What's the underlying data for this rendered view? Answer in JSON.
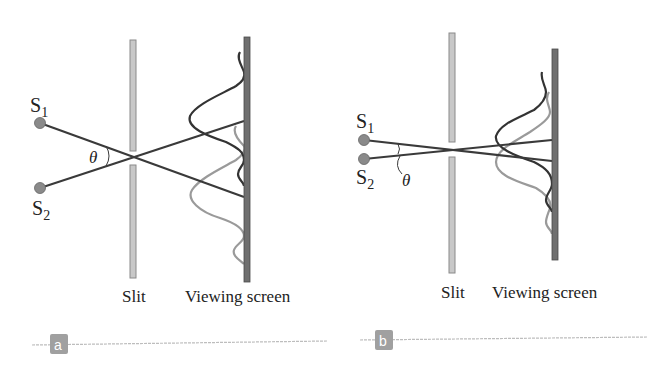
{
  "figure": {
    "panels": [
      {
        "id": "a",
        "badge": "a",
        "source1": {
          "label": "S",
          "sub": "1"
        },
        "source2": {
          "label": "S",
          "sub": "2"
        },
        "angle_label": "θ",
        "slit_label": "Slit",
        "screen_label": "Viewing screen"
      },
      {
        "id": "b",
        "badge": "b",
        "source1": {
          "label": "S",
          "sub": "1"
        },
        "source2": {
          "label": "S",
          "sub": "2"
        },
        "angle_label": "θ",
        "slit_label": "Slit",
        "screen_label": "Viewing screen"
      }
    ],
    "colors": {
      "ray": "#3a3a3a",
      "pattern_s1": "#333333",
      "pattern_s2": "#9a9a9a",
      "slit": "#c8c8c8",
      "slit_border": "#8a8a8a",
      "screen": "#6f6f6f",
      "source": "#8a8a8a",
      "badge": "#a0a0a0",
      "rule": "#bdbdbd"
    }
  }
}
